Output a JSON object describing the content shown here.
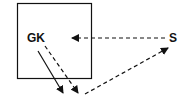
{
  "diagram": {
    "nodes": [
      {
        "id": "GK",
        "label": "GK"
      },
      {
        "id": "S",
        "label": "S"
      }
    ],
    "edges": [
      {
        "from": "S",
        "to": "GK",
        "style": "dashed"
      },
      {
        "from": "GK",
        "to": "below",
        "style": "solid"
      },
      {
        "from": "GK",
        "to": "below",
        "style": "dashed"
      },
      {
        "from": "below",
        "to": "S",
        "style": "dashed"
      }
    ],
    "colors": {
      "stroke": "#111111",
      "background": "#ffffff"
    }
  }
}
